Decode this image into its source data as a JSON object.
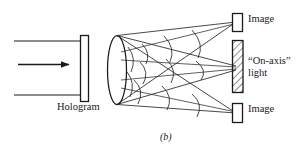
{
  "figure": {
    "panel_label": "(b)",
    "labels": {
      "hologram": "Hologram",
      "image_top": "Image",
      "on_axis": "“On-axis”\nlight",
      "on_axis_line1": "“On-axis”",
      "on_axis_line2": "light",
      "image_bottom": "Image"
    },
    "colors": {
      "ink": "#1a1a1a",
      "background": "#ffffff",
      "hatch": "#333333"
    },
    "elements": {
      "incident_beam": "plane-wave illumination arrow pointing right",
      "hologram_plate": "vertical clear rectangle",
      "diverging_cone": "elliptical aperture with diverging ray cone",
      "wavefronts": "curved arc segments across each beam",
      "on_axis_block": "hatched rectangle",
      "image_boxes": "two clear rectangles marking real/virtual image points"
    }
  }
}
